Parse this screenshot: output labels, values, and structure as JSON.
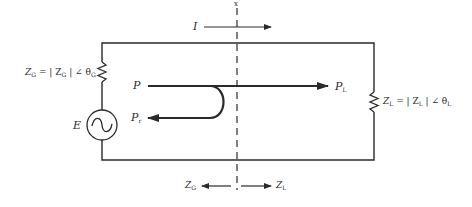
{
  "diagram": {
    "type": "circuit",
    "colors": {
      "line": "#2a2a2a",
      "background": "#ffffff"
    },
    "reference_plane": {
      "label": "x"
    },
    "current": {
      "label": "I"
    },
    "source": {
      "label": "E",
      "icon": "ac-source-icon"
    },
    "source_impedance": {
      "label_main": "Z",
      "label_sub": "G",
      "equation": "= | Z",
      "equation_sub": "G",
      "angle": "| ∠ θ",
      "angle_sub": "G"
    },
    "load_impedance": {
      "label_main": "Z",
      "label_sub": "L",
      "equation": "= | Z",
      "equation_sub": "L",
      "angle": "| ∠ θ",
      "angle_sub": "L"
    },
    "power": {
      "incident": "P",
      "delivered_main": "P",
      "delivered_sub": "L",
      "reflected_main": "P",
      "reflected_sub": "r"
    },
    "bottom_arrows": {
      "left_main": "Z",
      "left_sub": "G",
      "right_main": "Z",
      "right_sub": "L"
    }
  }
}
